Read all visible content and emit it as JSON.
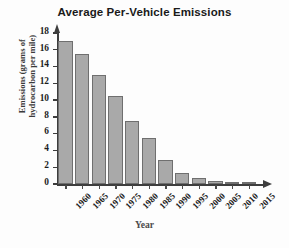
{
  "chart_data": {
    "type": "bar",
    "title": "Average Per-Vehicle Emissions",
    "xlabel": "Year",
    "ylabel": "Emissions (grams of hydrocarbon per mile)",
    "ylabel_line1": "Emissions (grams of",
    "ylabel_line2": "hydrocarbon per mile)",
    "categories": [
      "1960",
      "1965",
      "1970",
      "1975",
      "1980",
      "1985",
      "1990",
      "1995",
      "2000",
      "2005",
      "2010",
      "2015"
    ],
    "values": [
      17,
      15.5,
      13,
      10.5,
      7.5,
      5.5,
      2.9,
      1.3,
      0.7,
      0.4,
      0.2,
      0.15
    ],
    "ylim": [
      0,
      18
    ],
    "ytick_values": [
      0,
      2,
      4,
      6,
      8,
      10,
      12,
      14,
      16,
      18
    ],
    "ytick_labels": [
      "0",
      "2",
      "4",
      "6",
      "8",
      "10",
      "12",
      "14",
      "16",
      "18"
    ],
    "grid": false,
    "legend": "none",
    "bar_color": "#a9a9a9",
    "bar_edge_color": "#6f6f6f",
    "axis_color": "#3d3d3d",
    "title_color": "#1a1a1a",
    "background": "#fdfdfd"
  }
}
